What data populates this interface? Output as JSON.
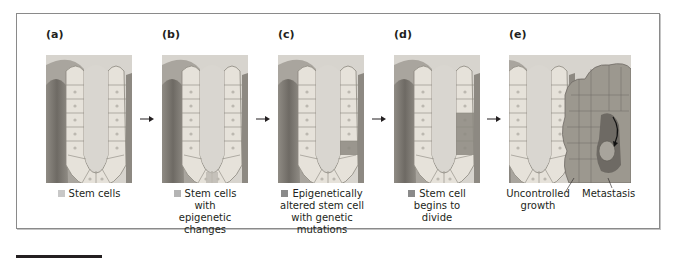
{
  "figure": {
    "panels": [
      {
        "label": "(a)",
        "caption_lines": [
          "Stem cells"
        ],
        "swatch_color": "#c8c8c8",
        "has_swatch": true
      },
      {
        "label": "(b)",
        "caption_lines": [
          "Stem cells",
          "with",
          "epigenetic",
          "changes"
        ],
        "swatch_color": "#b4b4b4",
        "has_swatch": true
      },
      {
        "label": "(c)",
        "caption_lines": [
          "Epigenetically",
          "altered stem cell",
          "with genetic",
          "mutations"
        ],
        "swatch_color": "#8a8a8a",
        "has_swatch": true
      },
      {
        "label": "(d)",
        "caption_lines": [
          "Stem cell",
          "begins to",
          "divide"
        ],
        "swatch_color": "#8a8a8a",
        "has_swatch": true
      },
      {
        "label": "(e)",
        "annotations": [
          "Uncontrolled",
          "growth",
          "Metastasis"
        ],
        "has_swatch": false
      }
    ],
    "arrows": 4,
    "colors": {
      "frame_border": "#8a8a8a",
      "text": "#231f20",
      "illustration_bg": "#dcd9d3",
      "cell_light": "#e8e4dc",
      "cell_mid": "#b9b5ad",
      "cell_dark": "#8c8880",
      "tissue_dark": "#6e6a64"
    }
  }
}
